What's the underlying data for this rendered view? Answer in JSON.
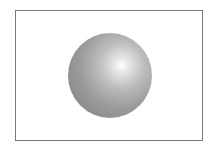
{
  "figure": {
    "shape": "sphere",
    "frame": "rectangular-border",
    "colors": {
      "highlight": "#ffffff",
      "midtone": "#b0b0b0",
      "shadow": "#7e7e7e",
      "border": "#7a7a7a",
      "background": "#ffffff"
    }
  }
}
